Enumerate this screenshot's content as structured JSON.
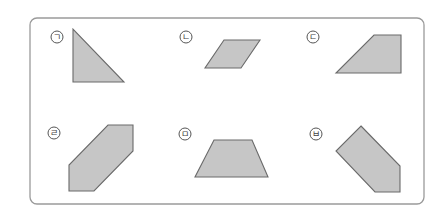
{
  "figure": {
    "frame": {
      "x": 30,
      "y": 18,
      "width": 394,
      "height": 186,
      "radius": 7,
      "stroke": "#9a9a9a"
    },
    "fill_color": "#c6c6c6",
    "stroke_color": "#6a6a6a",
    "items": [
      {
        "label": "ㄱ",
        "shape": "right-triangle",
        "label_pos": [
          57,
          37
        ],
        "points": "73,29 73,82 124,82"
      },
      {
        "label": "ㄴ",
        "shape": "parallelogram",
        "label_pos": [
          186,
          37
        ],
        "points": "224,40 260,40 241,68 205,68"
      },
      {
        "label": "ㄷ",
        "shape": "right-trapezoid",
        "label_pos": [
          313,
          37
        ],
        "points": "374,35 401,35 401,73 336,73"
      },
      {
        "label": "ㄹ",
        "shape": "hexagon",
        "label_pos": [
          54,
          133
        ],
        "points": "108,125 133,125 133,151 94,191 69,191 69,165"
      },
      {
        "label": "ㅁ",
        "shape": "isosceles-trapezoid",
        "label_pos": [
          185,
          134
        ],
        "points": "214,140 252,140 268,177 195,177"
      },
      {
        "label": "ㅂ",
        "shape": "pentagon",
        "label_pos": [
          316,
          134
        ],
        "points": "361,126 400,166 400,192 375,192 336,151"
      }
    ]
  }
}
